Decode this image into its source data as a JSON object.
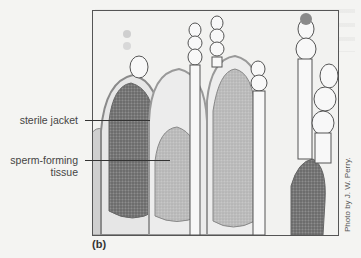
{
  "figure": {
    "panel_letter": "(b)",
    "credit": "Photo by J. W. Perry.",
    "labels": [
      {
        "text": "sterile jacket",
        "target": "jacket layer of antheridium"
      },
      {
        "text": "sperm-forming tissue",
        "line1": "sperm-forming",
        "line2": "tissue",
        "target": "interior of antheridium"
      }
    ],
    "image_description": "Light micrograph of moss antheridia with surrounding paraphyses",
    "colors": {
      "border": "#555555",
      "leader_line": "#333333",
      "label_text": "#444444",
      "dark_tissue": "#6e6e6e",
      "light_tissue": "#b8b8b8"
    }
  }
}
